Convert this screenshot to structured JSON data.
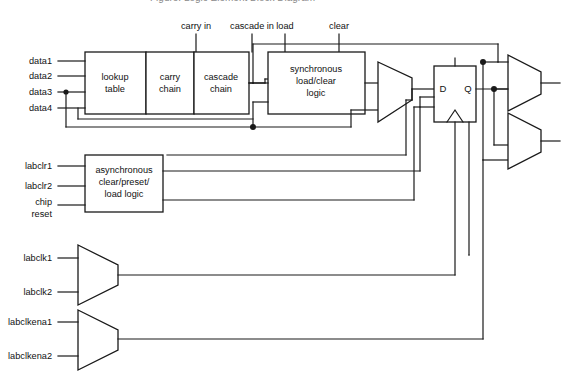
{
  "diagram": {
    "title_partial": "Figure: Logic Element Block Diagram",
    "blocks": {
      "lookup_table": "lookup\ntable",
      "lookup_table_l1": "lookup",
      "lookup_table_l2": "table",
      "carry_chain_l1": "carry",
      "carry_chain_l2": "chain",
      "cascade_chain_l1": "cascade",
      "cascade_chain_l2": "chain",
      "sync_logic_l1": "synchronous",
      "sync_logic_l2": "load/clear",
      "sync_logic_l3": "logic",
      "async_logic_l1": "asynchronous",
      "async_logic_l2": "clear/preset/",
      "async_logic_l3": "load logic"
    },
    "flipflop": {
      "d_label": "D",
      "q_label": "Q"
    },
    "top_inputs": [
      {
        "label": "carry in"
      },
      {
        "label": "cascade in"
      },
      {
        "label": "load"
      },
      {
        "label": "clear"
      }
    ],
    "data_inputs": [
      {
        "label": "data1"
      },
      {
        "label": "data2"
      },
      {
        "label": "data3"
      },
      {
        "label": "data4"
      }
    ],
    "async_inputs": [
      {
        "label": "labclr1"
      },
      {
        "label": "labclr2"
      },
      {
        "label_l1": "chip",
        "label_l2": "reset"
      }
    ],
    "clock_inputs": [
      {
        "label": "labclk1"
      },
      {
        "label": "labclk2"
      }
    ],
    "clkena_inputs": [
      {
        "label": "labclkena1"
      },
      {
        "label": "labclkena2"
      }
    ],
    "colors": {
      "line": "#1a1a1a",
      "background": "#ffffff",
      "text": "#111111"
    }
  }
}
